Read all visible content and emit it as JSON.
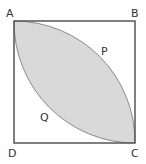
{
  "diagram": {
    "type": "geometry",
    "shape": "square with two quarter-circle arcs forming a shaded lens",
    "labels": {
      "A": "A",
      "B": "B",
      "C": "C",
      "D": "D",
      "P": "P",
      "Q": "Q"
    },
    "colors": {
      "stroke": "#555555",
      "fill": "#d9d9d9",
      "background": "#ffffff",
      "text": "#333333"
    }
  }
}
